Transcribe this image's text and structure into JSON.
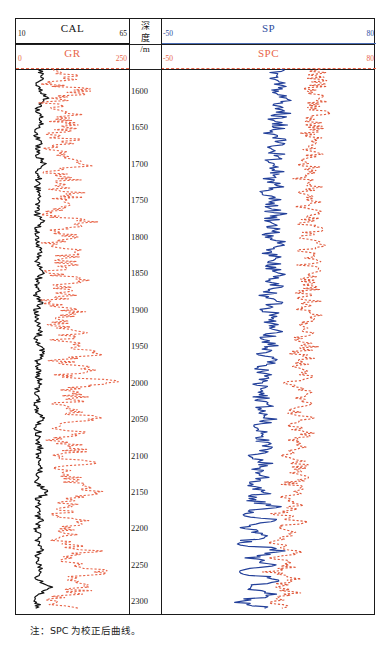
{
  "figure": {
    "caption": "注：SPC 为校正后曲线。"
  },
  "colors": {
    "cal_curve": "#141414",
    "gr_curve": "#E8664A",
    "sp_curve": "#23409A",
    "spc_curve": "#E05A3C",
    "frame": "#1a1a1a",
    "depth_text": "#1a1a1a"
  },
  "depth_axis": {
    "label_line1": "深",
    "label_line2": "度",
    "label_line3": "/m",
    "unit": "m",
    "ticks": [
      1600,
      1650,
      1700,
      1750,
      1800,
      1850,
      1900,
      1950,
      2000,
      2050,
      2100,
      2150,
      2200,
      2250,
      2300
    ],
    "top_depth": 1570,
    "bottom_depth": 2320
  },
  "tracks": [
    {
      "id": "track-left",
      "curves": [
        {
          "name": "CAL",
          "min": "10",
          "max": "65",
          "style": "solid",
          "color": "#141414",
          "units": "cm"
        },
        {
          "name": "GR",
          "min": "0",
          "max": "250",
          "style": "dashed",
          "color": "#E8664A",
          "units": "API"
        }
      ]
    },
    {
      "id": "track-right",
      "curves": [
        {
          "name": "SP",
          "min": "-50",
          "max": "80",
          "style": "solid",
          "color": "#23409A",
          "units": "mV"
        },
        {
          "name": "SPC",
          "min": "-50",
          "max": "80",
          "style": "dashed",
          "color": "#E05A3C",
          "units": "mV"
        }
      ]
    }
  ],
  "chart_data": {
    "type": "line",
    "title": "",
    "orientation": "vertical-depth-log",
    "xlabel": "",
    "ylabel": "深度/m",
    "ylim": [
      1570,
      2320
    ],
    "grid": false,
    "legend": "header-scales",
    "series": [
      {
        "name": "CAL",
        "track": "track-left",
        "color": "#141414",
        "style": "solid",
        "xlim": [
          10,
          65
        ],
        "depths": [
          1570,
          1580,
          1590,
          1600,
          1610,
          1620,
          1630,
          1640,
          1650,
          1660,
          1670,
          1680,
          1690,
          1700,
          1710,
          1720,
          1730,
          1740,
          1750,
          1760,
          1770,
          1780,
          1790,
          1800,
          1810,
          1820,
          1830,
          1840,
          1850,
          1860,
          1870,
          1880,
          1890,
          1900,
          1910,
          1920,
          1930,
          1940,
          1950,
          1960,
          1970,
          1980,
          1990,
          2000,
          2010,
          2020,
          2030,
          2040,
          2050,
          2060,
          2070,
          2080,
          2090,
          2100,
          2110,
          2120,
          2130,
          2140,
          2150,
          2160,
          2170,
          2180,
          2190,
          2200,
          2210,
          2220,
          2230,
          2240,
          2250,
          2260,
          2270,
          2280,
          2290,
          2300,
          2310
        ],
        "values": [
          21,
          23,
          20,
          22,
          25,
          21,
          20,
          23,
          21,
          20,
          22,
          20,
          21,
          24,
          20,
          21,
          20,
          22,
          20,
          21,
          20,
          23,
          20,
          21,
          20,
          22,
          20,
          21,
          23,
          20,
          21,
          20,
          22,
          20,
          21,
          20,
          22,
          20,
          21,
          24,
          20,
          21,
          20,
          22,
          20,
          21,
          20,
          21,
          23,
          20,
          21,
          20,
          22,
          20,
          21,
          22,
          20,
          21,
          26,
          20,
          21,
          20,
          22,
          20,
          21,
          20,
          22,
          20,
          21,
          23,
          20,
          28,
          21,
          20,
          21
        ]
      },
      {
        "name": "GR",
        "track": "track-left",
        "color": "#E8664A",
        "style": "dashed",
        "xlim": [
          0,
          250
        ],
        "depths": [
          1570,
          1580,
          1590,
          1600,
          1610,
          1620,
          1630,
          1640,
          1650,
          1660,
          1670,
          1680,
          1690,
          1700,
          1710,
          1720,
          1730,
          1740,
          1750,
          1760,
          1770,
          1780,
          1790,
          1800,
          1810,
          1820,
          1830,
          1840,
          1850,
          1860,
          1870,
          1880,
          1890,
          1900,
          1910,
          1920,
          1930,
          1940,
          1950,
          1960,
          1970,
          1980,
          1990,
          2000,
          2010,
          2020,
          2030,
          2040,
          2050,
          2060,
          2070,
          2080,
          2090,
          2100,
          2110,
          2120,
          2130,
          2140,
          2150,
          2160,
          2170,
          2180,
          2190,
          2200,
          2210,
          2220,
          2230,
          2240,
          2250,
          2260,
          2270,
          2280,
          2290,
          2300,
          2310
        ],
        "values": [
          95,
          130,
          80,
          150,
          105,
          70,
          140,
          90,
          120,
          75,
          135,
          85,
          110,
          160,
          80,
          125,
          70,
          145,
          95,
          115,
          78,
          150,
          88,
          130,
          72,
          140,
          100,
          118,
          82,
          145,
          92,
          125,
          70,
          135,
          105,
          85,
          150,
          95,
          120,
          210,
          88,
          165,
          100,
          230,
          92,
          140,
          110,
          125,
          175,
          95,
          130,
          85,
          150,
          105,
          160,
          90,
          140,
          115,
          195,
          100,
          135,
          88,
          155,
          108,
          128,
          95,
          165,
          110,
          140,
          185,
          100,
          150,
          120,
          95,
          110
        ]
      },
      {
        "name": "SP",
        "track": "track-right",
        "color": "#23409A",
        "style": "solid",
        "xlim": [
          -50,
          80
        ],
        "depths": [
          1570,
          1580,
          1590,
          1600,
          1610,
          1620,
          1630,
          1640,
          1650,
          1660,
          1670,
          1680,
          1690,
          1700,
          1710,
          1720,
          1730,
          1740,
          1750,
          1760,
          1770,
          1780,
          1790,
          1800,
          1810,
          1820,
          1830,
          1840,
          1850,
          1860,
          1870,
          1880,
          1890,
          1900,
          1910,
          1920,
          1930,
          1940,
          1950,
          1960,
          1970,
          1980,
          1990,
          2000,
          2010,
          2020,
          2030,
          2040,
          2050,
          2060,
          2070,
          2080,
          2090,
          2100,
          2110,
          2120,
          2130,
          2140,
          2150,
          2160,
          2170,
          2180,
          2190,
          2200,
          2210,
          2220,
          2230,
          2240,
          2250,
          2260,
          2270,
          2280,
          2290,
          2300,
          2310
        ],
        "values": [
          22,
          20,
          24,
          18,
          26,
          19,
          25,
          17,
          23,
          16,
          24,
          15,
          22,
          14,
          21,
          13,
          23,
          12,
          20,
          14,
          22,
          13,
          21,
          15,
          23,
          14,
          20,
          16,
          22,
          15,
          21,
          13,
          20,
          14,
          22,
          16,
          19,
          12,
          18,
          10,
          17,
          9,
          16,
          8,
          15,
          11,
          14,
          9,
          16,
          7,
          15,
          10,
          14,
          6,
          13,
          9,
          12,
          5,
          14,
          2,
          18,
          -2,
          20,
          0,
          16,
          -4,
          22,
          3,
          18,
          -6,
          24,
          1,
          20,
          -3,
          19
        ]
      },
      {
        "name": "SPC",
        "track": "track-right",
        "color": "#E05A3C",
        "style": "dashed",
        "xlim": [
          -50,
          80
        ],
        "depths": [
          1570,
          1580,
          1590,
          1600,
          1610,
          1620,
          1630,
          1640,
          1650,
          1660,
          1670,
          1680,
          1690,
          1700,
          1710,
          1720,
          1730,
          1740,
          1750,
          1760,
          1770,
          1780,
          1790,
          1800,
          1810,
          1820,
          1830,
          1840,
          1850,
          1860,
          1870,
          1880,
          1890,
          1900,
          1910,
          1920,
          1930,
          1940,
          1950,
          1960,
          1970,
          1980,
          1990,
          2000,
          2010,
          2020,
          2030,
          2040,
          2050,
          2060,
          2070,
          2080,
          2090,
          2100,
          2110,
          2120,
          2130,
          2140,
          2150,
          2160,
          2170,
          2180,
          2190,
          2200,
          2210,
          2220,
          2230,
          2240,
          2250,
          2260,
          2270,
          2280,
          2290,
          2300,
          2310
        ],
        "values": [
          46,
          42,
          48,
          40,
          50,
          41,
          47,
          39,
          45,
          38,
          46,
          37,
          44,
          36,
          45,
          35,
          44,
          34,
          43,
          36,
          45,
          35,
          43,
          37,
          46,
          36,
          42,
          38,
          44,
          37,
          43,
          35,
          42,
          36,
          44,
          38,
          41,
          34,
          40,
          32,
          39,
          31,
          38,
          30,
          37,
          33,
          36,
          31,
          38,
          29,
          37,
          32,
          36,
          28,
          35,
          31,
          34,
          27,
          36,
          24,
          32,
          20,
          34,
          22,
          30,
          18,
          33,
          21,
          31,
          17,
          34,
          19,
          30,
          16,
          28
        ]
      }
    ]
  }
}
